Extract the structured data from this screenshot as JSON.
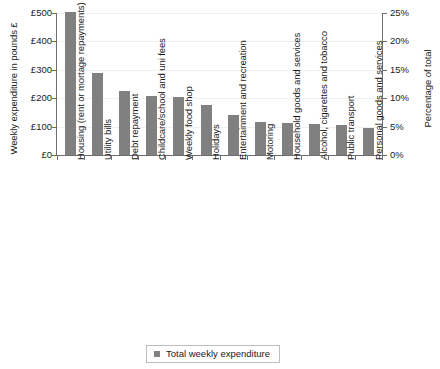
{
  "chart_data": {
    "type": "bar",
    "title": "",
    "categories": [
      "Housing (rent or mortage repayments)",
      "Utility bills",
      "Debt repayment",
      "Childcare/school and uni fees",
      "Weekly food shop",
      "Holidays",
      "Entertainment and recreation",
      "Motoring",
      "Household goods and services",
      "Alcohol, cigarettes and tobacco",
      "Public transport",
      "Personal goods and services"
    ],
    "values": [
      505,
      290,
      225,
      208,
      205,
      175,
      140,
      118,
      113,
      110,
      105,
      95
    ],
    "series": [
      {
        "name": "Total weekly expenditure",
        "values": [
          505,
          290,
          225,
          208,
          205,
          175,
          140,
          118,
          113,
          110,
          105,
          95
        ]
      }
    ],
    "xlabel": "",
    "ylabel": "Weekly expenditure in pounds £",
    "ylabel_secondary": "Percentage of total",
    "ylim": [
      0,
      500
    ],
    "ylim_secondary": [
      0,
      25
    ],
    "yticks": [
      "£0",
      "£100",
      "£200",
      "£300",
      "£400",
      "£500"
    ],
    "ytick_values": [
      0,
      100,
      200,
      300,
      400,
      500
    ],
    "yticks_secondary": [
      "0%",
      "5%",
      "10%",
      "15%",
      "20%",
      "25%"
    ],
    "ytick_values_secondary": [
      0,
      5,
      10,
      15,
      20,
      25
    ],
    "grid": true,
    "legend_position": "bottom",
    "legend": [
      "Total weekly expenditure"
    ],
    "bar_color": "#808080",
    "axis_color": "#6e6e6e",
    "grid_color": "#f0f0f0"
  },
  "legend": {
    "label": "Total weekly expenditure",
    "marker": "square-marker"
  }
}
